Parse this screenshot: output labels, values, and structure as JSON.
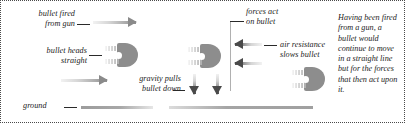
{
  "diagram": {
    "border_style": "dotted",
    "labels": {
      "bullet_fired": "bullet fired\nfrom gun",
      "bullet_heads_straight": "bullet heads\nstraight",
      "gravity": "gravity pulls\nbullet down",
      "ground": "ground",
      "forces_act": "forces act\non bullet",
      "air_resistance": "air resistance\nslows bullet"
    },
    "caption": "Having been fired from a gun, a bullet would continue to move in a straight line but for the forces that then act upon it.",
    "icons": {
      "motion_arrow_right": "arrow-right-icon",
      "gravity_arrow_down": "arrow-down-icon",
      "air_resistance_arrow_left": "arrow-left-icon",
      "bullet": "bullet-icon",
      "ground_line": "ground-line-icon"
    },
    "colors": {
      "bullet_gray": "#8d8d8d",
      "arrow_dark": "#4a4a4a",
      "arrow_light": "#d8d8d8",
      "text": "#1b1b1b",
      "border": "#4a4a4a",
      "background": "#ffffff"
    }
  }
}
